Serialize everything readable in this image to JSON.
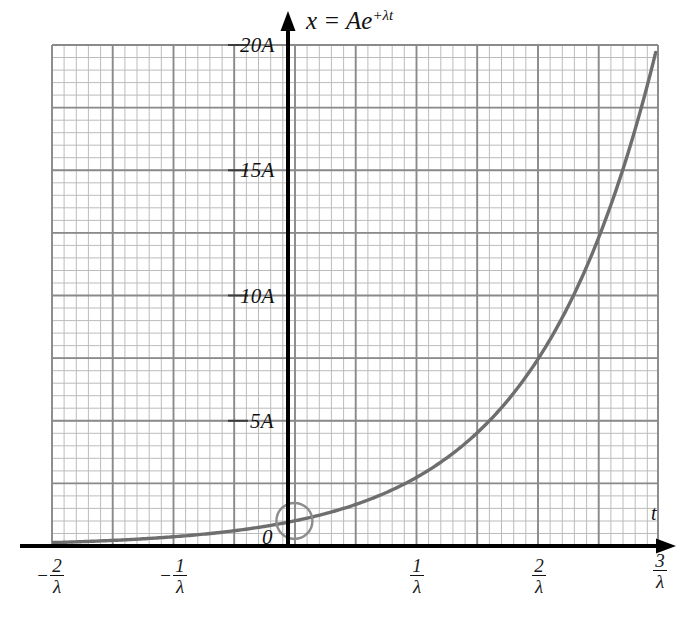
{
  "figure": {
    "equation_parts": {
      "lhs": "x = Ae",
      "exponent": "+λt"
    },
    "axis_labels": {
      "x": "t",
      "y_zero": "0"
    },
    "y_ticks": [
      "0",
      "5A",
      "10A",
      "15A",
      "20A"
    ],
    "x_ticks": [
      {
        "sign": "−",
        "num": "2",
        "den": "λ"
      },
      {
        "sign": "−",
        "num": "1",
        "den": "λ"
      },
      {
        "sign": "",
        "num": "1",
        "den": "λ"
      },
      {
        "sign": "",
        "num": "2",
        "den": "λ"
      },
      {
        "sign": "",
        "num": "3",
        "den": "λ"
      }
    ],
    "colors": {
      "curve": "#6e6e6e",
      "grid_minor": "#b9b9b9",
      "grid_major": "#8a8a8a",
      "axis": "#000000",
      "marker": "#8c8c8c",
      "background": "#ffffff"
    }
  },
  "chart_data": {
    "type": "line",
    "xlabel": "t",
    "ylabel": "x",
    "grid": true,
    "legend": "none",
    "xlim": [
      -2,
      3
    ],
    "ylim": [
      0,
      20
    ],
    "x_unit": "1/λ",
    "y_unit": "A",
    "x_tick_values": [
      -2,
      -1,
      0,
      1,
      2,
      3
    ],
    "x_tick_labels": [
      "−2/λ",
      "−1/λ",
      "0",
      "1/λ",
      "2/λ",
      "3/λ"
    ],
    "y_tick_values": [
      0,
      5,
      10,
      15,
      20
    ],
    "y_tick_labels": [
      "0",
      "5A",
      "10A",
      "15A",
      "20A"
    ],
    "series": [
      {
        "name": "x = Ae^{+λt}",
        "function": "y = exp(x)  (in units of A vs 1/λ)",
        "x": [
          -2,
          -1.75,
          -1.5,
          -1.25,
          -1,
          -0.75,
          -0.5,
          -0.25,
          0,
          0.25,
          0.5,
          0.75,
          1,
          1.25,
          1.5,
          1.75,
          2,
          2.25,
          2.5,
          2.75,
          3
        ],
        "values": [
          0.14,
          0.17,
          0.22,
          0.29,
          0.37,
          0.47,
          0.61,
          0.78,
          1.0,
          1.28,
          1.65,
          2.12,
          2.72,
          3.49,
          4.48,
          5.75,
          7.39,
          9.49,
          12.18,
          15.64,
          20.09
        ]
      }
    ],
    "annotations": [
      {
        "type": "circle-marker",
        "x": 0,
        "y": 1,
        "note": "highlighted point at t=0, x=A"
      }
    ]
  }
}
